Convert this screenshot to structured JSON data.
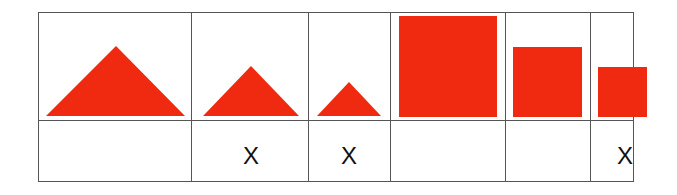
{
  "diagram": {
    "shape_color": "#f02a10",
    "line_color": "#555555",
    "columns": [
      {
        "shape": "triangle",
        "size": "large",
        "mark": ""
      },
      {
        "shape": "triangle",
        "size": "medium",
        "mark": "X"
      },
      {
        "shape": "triangle",
        "size": "small",
        "mark": "X"
      },
      {
        "shape": "square",
        "size": "large",
        "mark": ""
      },
      {
        "shape": "square",
        "size": "medium",
        "mark": ""
      },
      {
        "shape": "square",
        "size": "small",
        "mark": "X"
      }
    ]
  }
}
